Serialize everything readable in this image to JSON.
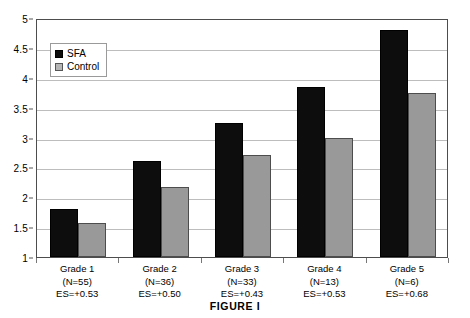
{
  "caption": "FIGURE I",
  "legend": {
    "position": "top-left-inside",
    "items": [
      {
        "label": "SFA",
        "color": "#0d0d0d",
        "swatch": "legend-swatch-sfa"
      },
      {
        "label": "Control",
        "color": "#999999",
        "swatch": "legend-swatch-control"
      }
    ]
  },
  "axis": {
    "y_ticks": [
      "1",
      "1.5",
      "2",
      "2.5",
      "3",
      "3.5",
      "4",
      "4.5",
      "5"
    ]
  },
  "categories": [
    {
      "grade": "Grade 1",
      "n": "(N=55)",
      "es": "ES=+0.53"
    },
    {
      "grade": "Grade 2",
      "n": "(N=36)",
      "es": "ES=+0.50"
    },
    {
      "grade": "Grade 3",
      "n": "(N=33)",
      "es": "ES=+0.43"
    },
    {
      "grade": "Grade 4",
      "n": "(N=13)",
      "es": "ES=+0.53"
    },
    {
      "grade": "Grade 5",
      "n": "(N=6)",
      "es": "ES=+0.68"
    }
  ],
  "chart_data": {
    "type": "bar",
    "title": "FIGURE I",
    "xlabel": "",
    "ylabel": "",
    "ylim": [
      1,
      5
    ],
    "ytick_step": 0.5,
    "grid": true,
    "legend_position": "upper left (inside plot)",
    "categories": [
      "Grade 1",
      "Grade 2",
      "Grade 3",
      "Grade 4",
      "Grade 5"
    ],
    "category_sublabels": [
      [
        "(N=55)",
        "ES=+0.53"
      ],
      [
        "(N=36)",
        "ES=+0.50"
      ],
      [
        "(N=33)",
        "ES=+0.43"
      ],
      [
        "(N=13)",
        "ES=+0.53"
      ],
      [
        "(N=6)",
        "ES=+0.68"
      ]
    ],
    "series": [
      {
        "name": "SFA",
        "color": "#0d0d0d",
        "values": [
          1.8,
          2.6,
          3.25,
          3.85,
          4.8
        ]
      },
      {
        "name": "Control",
        "color": "#999999",
        "values": [
          1.57,
          2.17,
          2.7,
          3.0,
          3.75
        ]
      }
    ],
    "effect_sizes": [
      0.53,
      0.5,
      0.43,
      0.53,
      0.68
    ],
    "sample_sizes": [
      55,
      36,
      33,
      13,
      6
    ]
  }
}
